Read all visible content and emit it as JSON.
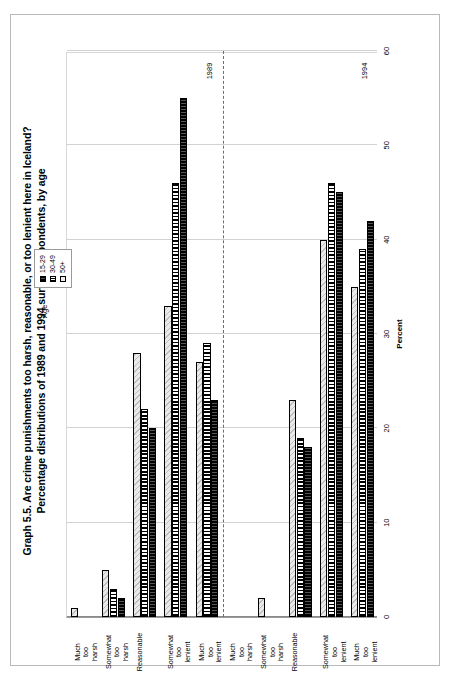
{
  "figure": {
    "title_line1": "Graph 5.5.  Are crime punishments too harsh, reasonable, or too lenient here in Iceland?",
    "title_line2": "Percentage distributions of 1989 and 1994 survey respondents, by age"
  },
  "legend": {
    "title": "Age",
    "entries": [
      {
        "label": "15-29",
        "style": "s0"
      },
      {
        "label": "30-49",
        "style": "s1"
      },
      {
        "label": "50+",
        "style": "s2"
      }
    ]
  },
  "chart_data": {
    "type": "bar",
    "orientation": "horizontal",
    "title": "Graph 5.5.  Are crime punishments too harsh, reasonable, or too lenient here in Iceland?",
    "subtitle": "Percentage distributions of 1989 and 1994 survey respondents, by age",
    "xlabel": "",
    "ylabel": "Percent",
    "value_axis_label": "Percent",
    "ylim": [
      0,
      60
    ],
    "ticks": [
      0,
      10,
      20,
      30,
      40,
      50,
      60
    ],
    "grid": true,
    "legend_position": "top-right",
    "group_labels": [
      "1989",
      "1994"
    ],
    "categories": [
      "Much too harsh",
      "Somewhat too harsh",
      "Reasonable",
      "Somewhat too lenient",
      "Much too lenient"
    ],
    "series": [
      {
        "name": "15-29",
        "style": "s0"
      },
      {
        "name": "30-49",
        "style": "s1"
      },
      {
        "name": "50+",
        "style": "s2"
      }
    ],
    "groups": [
      {
        "year": "1989",
        "values": {
          "15-29": [
            0,
            2,
            20,
            55,
            23
          ],
          "30-49": [
            0,
            3,
            22,
            46,
            29
          ],
          "50+": [
            1,
            5,
            28,
            33,
            27
          ]
        }
      },
      {
        "year": "1994",
        "values": {
          "15-29": [
            0,
            0,
            18,
            45,
            42
          ],
          "30-49": [
            0,
            0,
            19,
            46,
            39
          ],
          "50+": [
            0,
            2,
            23,
            40,
            35
          ]
        }
      }
    ]
  },
  "axis": {
    "tick_labels": [
      "0",
      "10",
      "20",
      "30",
      "40",
      "50",
      "60"
    ],
    "title": "Percent"
  }
}
